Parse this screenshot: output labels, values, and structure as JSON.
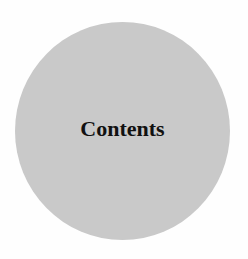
{
  "diagram": {
    "node": {
      "shape": "circle",
      "label": "Contents",
      "fill_color": "#c9c9c9",
      "text_color": "#111111"
    },
    "background_color": "#fefefe"
  }
}
